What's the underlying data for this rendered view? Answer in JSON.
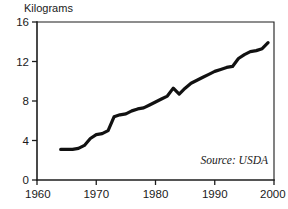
{
  "chart_data": {
    "type": "line",
    "title": "",
    "subtitle": "",
    "xlabel": "",
    "ylabel": "Kilograms",
    "xlim": [
      1960,
      2000
    ],
    "ylim": [
      0,
      16
    ],
    "xticks": [
      1960,
      1970,
      1980,
      1990,
      2000
    ],
    "xtick_labels": [
      "1960",
      "1970",
      "1980",
      "1990",
      "2000"
    ],
    "yticks": [
      0,
      4,
      8,
      12,
      16
    ],
    "ytick_labels": [
      "0",
      "4",
      "8",
      "12",
      "16"
    ],
    "grid": false,
    "legend": false,
    "annotations": [
      {
        "name": "source",
        "text": "Source: USDA",
        "position": "bottom-right-inside",
        "style": "italic"
      }
    ],
    "series": [
      {
        "name": "Per capita consumption",
        "color": "#111111",
        "x": [
          1964,
          1965,
          1966,
          1967,
          1968,
          1969,
          1970,
          1971,
          1972,
          1973,
          1974,
          1975,
          1976,
          1977,
          1978,
          1979,
          1980,
          1981,
          1982,
          1983,
          1984,
          1985,
          1986,
          1987,
          1988,
          1989,
          1990,
          1991,
          1992,
          1993,
          1994,
          1995,
          1996,
          1997,
          1998,
          1999
        ],
        "values": [
          3.1,
          3.1,
          3.1,
          3.2,
          3.5,
          4.2,
          4.6,
          4.7,
          5.0,
          6.4,
          6.6,
          6.7,
          7.0,
          7.2,
          7.3,
          7.6,
          7.9,
          8.2,
          8.5,
          9.3,
          8.7,
          9.3,
          9.8,
          10.1,
          10.4,
          10.7,
          11.0,
          11.2,
          11.4,
          11.5,
          12.3,
          12.7,
          13.0,
          13.1,
          13.3,
          13.9
        ]
      }
    ]
  },
  "labels": {
    "y_axis_title": "Kilograms",
    "source_note": "Source: USDA"
  }
}
